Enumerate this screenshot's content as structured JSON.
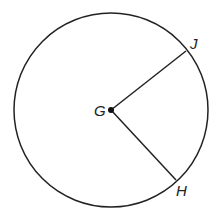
{
  "diagram": {
    "type": "circle-with-radii",
    "center": {
      "label": "G",
      "x": 111,
      "y": 110
    },
    "radius": 97,
    "points": [
      {
        "label": "J",
        "x": 186,
        "y": 51
      },
      {
        "label": "H",
        "x": 176,
        "y": 180
      }
    ],
    "segments": [
      [
        "G",
        "J"
      ],
      [
        "G",
        "H"
      ]
    ],
    "stroke_color": "#222222"
  }
}
